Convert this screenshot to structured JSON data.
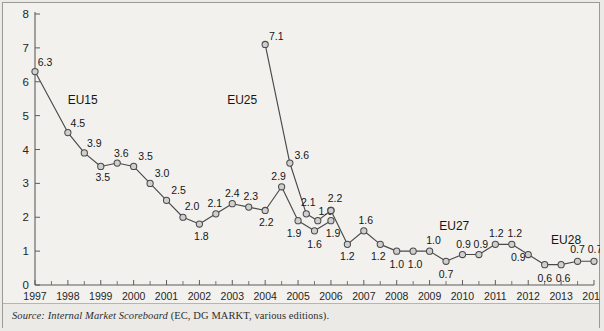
{
  "chart_data": {
    "type": "line",
    "title": "",
    "xlabel": "",
    "ylabel": "",
    "xlim": [
      1997,
      2014
    ],
    "ylim": [
      0,
      8
    ],
    "ytick_labels": [
      "0",
      "1",
      "2",
      "3",
      "4",
      "5",
      "6",
      "7",
      "8"
    ],
    "xtick_labels": [
      "1997",
      "1998",
      "1999",
      "2000",
      "2001",
      "2002",
      "2003",
      "2004",
      "2005",
      "2006",
      "2007",
      "2008",
      "2009",
      "2010",
      "2011",
      "2012",
      "2013",
      "2014"
    ],
    "grid": false,
    "legend_position": "inline-annotations",
    "minor_ticks_per_interval": 2,
    "annotations": [
      {
        "text": "EU15",
        "x": 1998.45,
        "y": 5.35,
        "bold": false
      },
      {
        "text": "EU25",
        "x": 2003.3,
        "y": 5.35,
        "bold": false
      },
      {
        "text": "EU27",
        "x": 2009.75,
        "y": 1.62,
        "bold": false
      },
      {
        "text": "EU28",
        "x": 2013.15,
        "y": 1.2,
        "bold": false
      }
    ],
    "series": [
      {
        "name": "EU15",
        "points": [
          {
            "x": 1997.0,
            "y": 6.3,
            "label": "6.3",
            "lx": 10,
            "ly": -6
          },
          {
            "x": 1998.0,
            "y": 4.5,
            "label": "4.5",
            "lx": 10,
            "ly": -6
          },
          {
            "x": 1998.5,
            "y": 3.9,
            "label": "3.9",
            "lx": 10,
            "ly": -6
          },
          {
            "x": 1999.0,
            "y": 3.5,
            "label": "3.5",
            "lx": 2,
            "ly": 15
          },
          {
            "x": 1999.5,
            "y": 3.6,
            "label": "3.6",
            "lx": 4,
            "ly": -6
          },
          {
            "x": 2000.0,
            "y": 3.5,
            "label": "3.5",
            "lx": 12,
            "ly": -6
          },
          {
            "x": 2000.5,
            "y": 3.0,
            "label": "3.0",
            "lx": 12,
            "ly": -6
          },
          {
            "x": 2001.0,
            "y": 2.5,
            "label": "2.5",
            "lx": 12,
            "ly": -6
          },
          {
            "x": 2001.5,
            "y": 2.0,
            "label": "2.0",
            "lx": 9,
            "ly": -7
          },
          {
            "x": 2002.0,
            "y": 1.8,
            "label": "1.8",
            "lx": 2,
            "ly": 16
          },
          {
            "x": 2002.5,
            "y": 2.1,
            "label": "2.1",
            "lx": -1,
            "ly": -7
          },
          {
            "x": 2003.0,
            "y": 2.4,
            "label": "2.4",
            "lx": 0,
            "ly": -7
          },
          {
            "x": 2003.5,
            "y": 2.3,
            "label": "2.3",
            "lx": 2,
            "ly": -7
          },
          {
            "x": 2004.0,
            "y": 2.2,
            "label": "2.2",
            "lx": 1,
            "ly": 16
          },
          {
            "x": 2004.5,
            "y": 2.9,
            "label": "2.9",
            "lx": -3,
            "ly": -7
          },
          {
            "x": 2005.0,
            "y": 1.9,
            "label": "1.9",
            "lx": -4,
            "ly": 16
          },
          {
            "x": 2005.5,
            "y": 1.6,
            "label": "1.6",
            "lx": 0,
            "ly": 17
          },
          {
            "x": 2006.0,
            "y": 1.9,
            "label": "1.9",
            "lx": 2,
            "ly": 16
          }
        ]
      },
      {
        "name": "EU25",
        "points": [
          {
            "x": 2004.0,
            "y": 7.1,
            "label": "7.1",
            "lx": 11,
            "ly": -4
          },
          {
            "x": 2004.75,
            "y": 3.6,
            "label": "3.6",
            "lx": 12,
            "ly": -4
          },
          {
            "x": 2005.25,
            "y": 2.1,
            "label": "2.1",
            "lx": 2,
            "ly": -8
          },
          {
            "x": 2005.6,
            "y": 1.9,
            "label": "1.9",
            "lx": 8,
            "ly": -6
          },
          {
            "x": 2006.0,
            "y": 2.2,
            "label": "2.2",
            "lx": 4,
            "ly": -8
          }
        ]
      },
      {
        "name": "EU27-EU28",
        "points": [
          {
            "x": 2006.0,
            "y": 2.2,
            "label": "",
            "lx": 0,
            "ly": 0
          },
          {
            "x": 2006.5,
            "y": 1.2,
            "label": "1.2",
            "lx": 0,
            "ly": 16
          },
          {
            "x": 2007.0,
            "y": 1.6,
            "label": "1.6",
            "lx": 2,
            "ly": -7
          },
          {
            "x": 2007.5,
            "y": 1.2,
            "label": "1.2",
            "lx": -2,
            "ly": 16
          },
          {
            "x": 2008.0,
            "y": 1.0,
            "label": "1.0",
            "lx": 0,
            "ly": 17
          },
          {
            "x": 2008.5,
            "y": 1.0,
            "label": "1.0",
            "lx": 2,
            "ly": 17
          },
          {
            "x": 2009.0,
            "y": 1.0,
            "label": "1.0",
            "lx": 4,
            "ly": -7
          },
          {
            "x": 2009.5,
            "y": 0.7,
            "label": "0.7",
            "lx": 0,
            "ly": 17
          },
          {
            "x": 2010.0,
            "y": 0.9,
            "label": "0.9",
            "lx": 1,
            "ly": -7
          },
          {
            "x": 2010.5,
            "y": 0.9,
            "label": "0.9",
            "lx": 2,
            "ly": -7
          },
          {
            "x": 2011.0,
            "y": 1.2,
            "label": "1.2",
            "lx": 1,
            "ly": -7
          },
          {
            "x": 2011.5,
            "y": 1.2,
            "label": "1.2",
            "lx": 3,
            "ly": -7
          },
          {
            "x": 2012.0,
            "y": 0.9,
            "label": "0.9",
            "lx": -10,
            "ly": 6
          },
          {
            "x": 2012.5,
            "y": 0.6,
            "label": "0.6",
            "lx": 0,
            "ly": 17
          },
          {
            "x": 2013.0,
            "y": 0.6,
            "label": "0.6",
            "lx": 2,
            "ly": 17
          },
          {
            "x": 2013.5,
            "y": 0.7,
            "label": "0.7",
            "lx": 0,
            "ly": -8
          },
          {
            "x": 2014.0,
            "y": 0.7,
            "label": "0.7",
            "lx": 1,
            "ly": -8
          }
        ]
      }
    ]
  },
  "source": {
    "prefix": "Source: Internal Market Scoreboard ",
    "suffix": "(EC, DG MARKT, various editions)."
  },
  "colors": {
    "line": "#4a4a4a",
    "marker_fill": "#cfcfcf",
    "axis": "#5d5d5d",
    "page_bg": "#eceae7",
    "plot_bg": "#f2f1ee",
    "text": "#161616"
  }
}
